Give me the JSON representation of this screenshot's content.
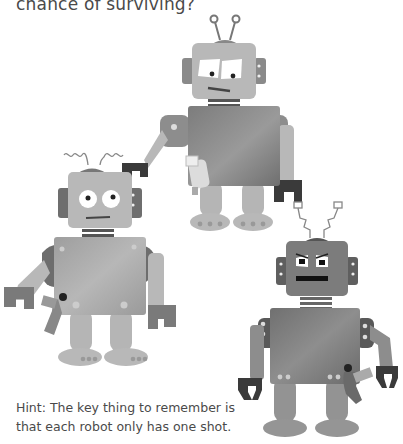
{
  "question": {
    "text_tail": "chance of surviving?"
  },
  "hint": {
    "line1": "Hint: The key thing to remember is",
    "line2": "that each robot only has one shot."
  },
  "illustration": {
    "robots": [
      {
        "name": "top-robot",
        "antenna": "straight-round",
        "expression": "uncertain"
      },
      {
        "name": "left-robot",
        "antenna": "coiled",
        "expression": "surprised"
      },
      {
        "name": "right-robot",
        "antenna": "zigzag",
        "expression": "angry"
      }
    ],
    "colors": {
      "light_gray": "#b5b5b5",
      "mid_gray": "#8f8f8f",
      "dark_gray": "#6e6e6e",
      "claw": "#3a3a3a",
      "torso_top": "#7a7a7a",
      "torso_left": "#a0a0a0",
      "torso_right": "#767676"
    }
  }
}
